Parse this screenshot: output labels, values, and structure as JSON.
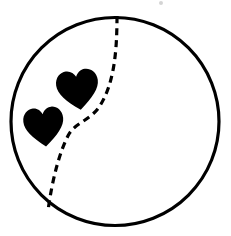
{
  "image": {
    "title": "Ball outline with dashed seam and two hearts",
    "kind": "line-drawing",
    "width": 231,
    "height": 236,
    "background_color": "#ffffff",
    "ink_color": "#000000"
  },
  "ball": {
    "label": "ball-outline",
    "shape": "circle",
    "center_x": 115,
    "center_y": 121.5,
    "radius": 104,
    "stroke_color": "#000000",
    "stroke_width": 3.2,
    "fill": "none"
  },
  "seam": {
    "label": "dashed-seam-curve",
    "stroke_color": "#000000",
    "stroke_width": 3.2,
    "dash_length": 7,
    "gap_length": 5,
    "start_x": 117,
    "start_y": 16,
    "end_x": 48,
    "end_y": 211,
    "path": "M 117 16 C 117 52, 114 82, 101 104 C 92 120, 76 122, 69 134 C 60 150, 52 180, 48 211"
  },
  "hearts": [
    {
      "label": "heart-upper",
      "center_x": 78,
      "center_y": 90,
      "width": 42,
      "height": 40,
      "rotation_deg": -8,
      "fill_color": "#000000"
    },
    {
      "label": "heart-lower",
      "center_x": 44,
      "center_y": 127,
      "width": 40,
      "height": 39,
      "rotation_deg": -6,
      "fill_color": "#000000"
    }
  ],
  "specks": [
    {
      "label": "speck-top",
      "x": 159,
      "y": 1,
      "size": 4
    }
  ]
}
